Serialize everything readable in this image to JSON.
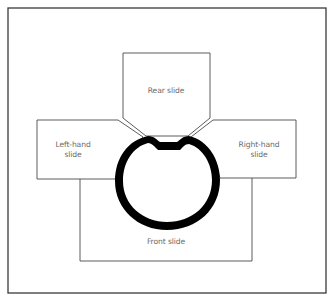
{
  "diagram": {
    "type": "technical-illustration",
    "colors": {
      "line": "#4a4a4a",
      "frame": "#3a3a3a",
      "ring": "#000000",
      "text": "#6a6a6a",
      "background": "#ffffff"
    },
    "labels": {
      "rear_slide": "Rear slide",
      "left_slide_line1": "Left-hand",
      "left_slide_line2": "slide",
      "right_slide_line1": "Right-hand",
      "right_slide_line2": "slide",
      "front_slide": "Front slide"
    },
    "elements": [
      {
        "name": "rear-slide",
        "label": "Rear slide"
      },
      {
        "name": "left-hand-slide",
        "label": "Left-hand slide"
      },
      {
        "name": "right-hand-slide",
        "label": "Right-hand slide"
      },
      {
        "name": "front-slide",
        "label": "Front slide"
      },
      {
        "name": "ring-part",
        "label": ""
      }
    ]
  }
}
